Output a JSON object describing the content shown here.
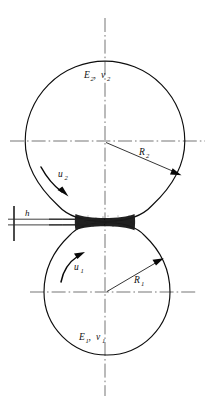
{
  "figure": {
    "background_color": "#ffffff",
    "ink_color": "#0d0d0d",
    "centerline_color": "#5d5d5d",
    "width": 212,
    "height": 414
  },
  "labels": {
    "upper_body_material": {
      "modulus": "E",
      "modulus_sub": "2",
      "separator": ",",
      "poisson": "ν",
      "poisson_sub": "2",
      "x": 84,
      "y": 78
    },
    "lower_body_material": {
      "modulus": "E",
      "modulus_sub": "1",
      "separator": ",",
      "poisson": "ν",
      "poisson_sub": "1",
      "x": 79,
      "y": 340
    },
    "upper_radius": {
      "symbol": "R",
      "sub": "2",
      "x": 139,
      "y": 155
    },
    "lower_radius": {
      "symbol": "R",
      "sub": "1",
      "x": 134,
      "y": 283
    },
    "upper_velocity": {
      "symbol": "u",
      "sub": "2",
      "x": 58,
      "y": 177
    },
    "lower_velocity": {
      "symbol": "u",
      "sub": "1",
      "x": 74,
      "y": 270
    },
    "film_thickness": {
      "symbol": "h",
      "x": 25,
      "y": 216
    }
  },
  "geometry": {
    "upper_sphere": {
      "cx": 105,
      "cy": 141,
      "r": 80
    },
    "lower_sphere": {
      "cx": 107,
      "cy": 292,
      "r": 63
    },
    "contact_center": {
      "x": 105,
      "y": 222
    },
    "vertical_axis": {
      "x": 105,
      "y_top": 18,
      "y_bottom": 396
    },
    "upper_horizontal_axis": {
      "y": 141,
      "x_left": 10,
      "x_right": 205
    },
    "lower_horizontal_axis": {
      "y": 292,
      "x_left": 30,
      "x_right": 195
    },
    "film_gap_half_height": 4.0,
    "film_half_width": 30
  },
  "annotations": {
    "upper_radius_leader": {
      "x1": 106,
      "y1": 142,
      "x2": 178,
      "y2": 173
    },
    "lower_radius_leader": {
      "x1": 107,
      "y1": 292,
      "x2": 160,
      "y2": 261
    },
    "h_marker": {
      "tick_x": 14,
      "tick_y_top": 206,
      "tick_y_bottom": 241,
      "line_x_end": 104,
      "y_upper": 219,
      "y_lower": 225
    }
  }
}
